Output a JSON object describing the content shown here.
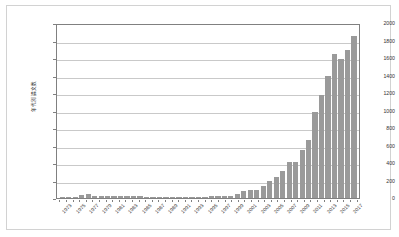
{
  "chart_data": {
    "type": "bar",
    "title": "",
    "xlabel": "",
    "ylabel": "年代別論文数",
    "ylim": [
      0,
      2000
    ],
    "ytick_step": 200,
    "yticks": [
      0,
      200,
      400,
      600,
      800,
      1000,
      1200,
      1400,
      1600,
      1800,
      2000
    ],
    "grid": true,
    "legend": "none",
    "bar_color": "#9a9a9a",
    "plot_border_color": "#808080",
    "gridline_color": "#c9c9c9",
    "frame_color": "#d2d2d2",
    "background": "#ffffff",
    "xtick_labels": [
      "1973",
      "1975",
      "1977",
      "1979",
      "1981",
      "1983",
      "1985",
      "1987",
      "1989",
      "1991",
      "1993",
      "1995",
      "1997",
      "1999",
      "2001",
      "2003",
      "2005",
      "2007",
      "2009",
      "2011",
      "2013",
      "2015",
      "2017"
    ],
    "xtick_label_interval": 2,
    "categories": [
      "1973",
      "1974",
      "1975",
      "1976",
      "1977",
      "1978",
      "1979",
      "1980",
      "1981",
      "1982",
      "1983",
      "1984",
      "1985",
      "1986",
      "1987",
      "1988",
      "1989",
      "1990",
      "1991",
      "1992",
      "1993",
      "1994",
      "1995",
      "1996",
      "1997",
      "1998",
      "1999",
      "2000",
      "2001",
      "2002",
      "2003",
      "2004",
      "2005",
      "2006",
      "2007",
      "2008",
      "2009",
      "2010",
      "2011",
      "2012",
      "2013",
      "2014",
      "2015",
      "2016",
      "2017",
      "2018"
    ],
    "values": [
      2,
      3,
      12,
      40,
      42,
      22,
      20,
      26,
      24,
      24,
      20,
      18,
      26,
      14,
      12,
      12,
      14,
      12,
      12,
      12,
      10,
      14,
      12,
      24,
      22,
      24,
      28,
      46,
      78,
      90,
      86,
      140,
      196,
      240,
      310,
      414,
      412,
      552,
      666,
      980,
      1180,
      1396,
      1644,
      1594,
      1688,
      1848
    ]
  }
}
